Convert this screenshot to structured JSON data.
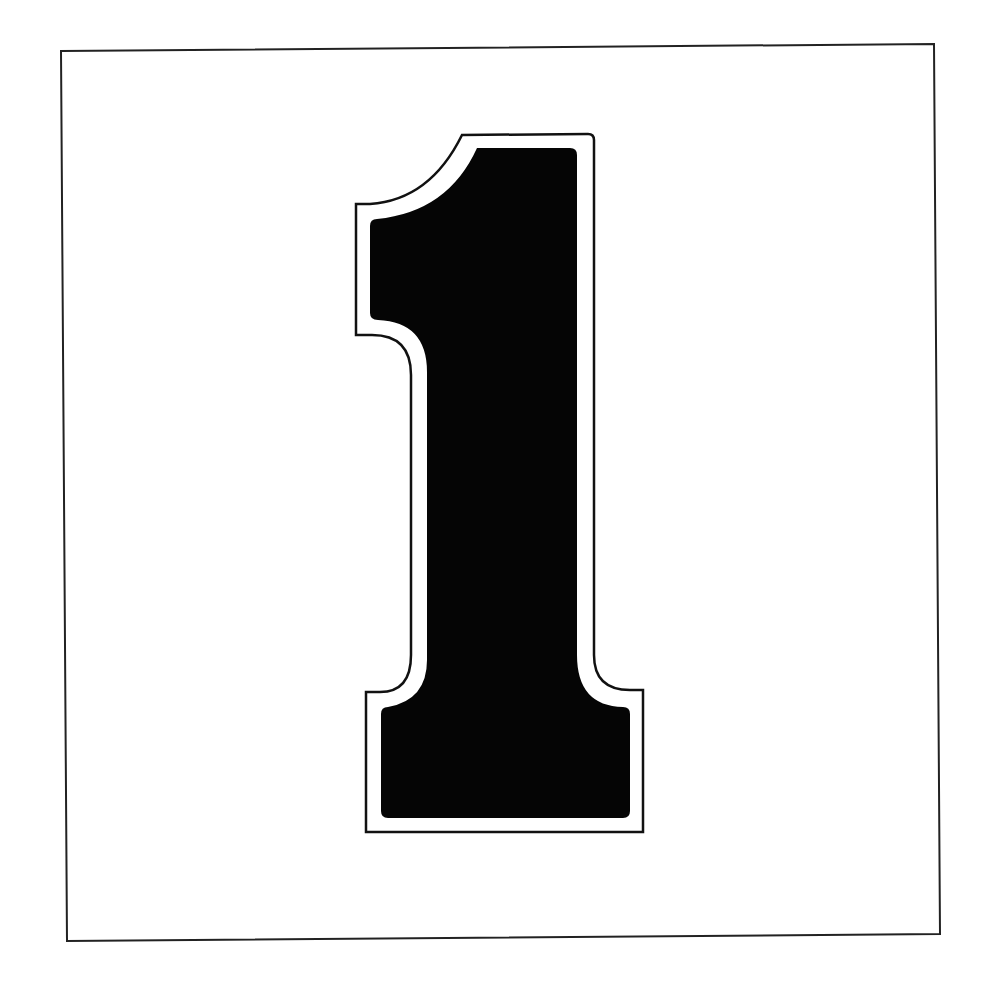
{
  "figure": {
    "glyph": "1",
    "colors": {
      "background": "#ffffff",
      "frame": "#222222",
      "numeral_fill": "#050505",
      "numeral_outline": "#111111",
      "numeral_inline": "#ffffff"
    }
  }
}
